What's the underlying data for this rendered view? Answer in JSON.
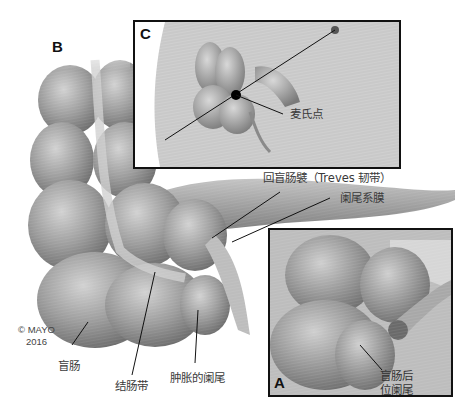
{
  "figure": {
    "panels": {
      "B": {
        "letter": "B"
      },
      "C": {
        "letter": "C",
        "labels": {
          "mcburney_point": "麦氏点"
        }
      },
      "A": {
        "letter": "A",
        "labels": {
          "retrocecal_appendix_line1": "盲肠后",
          "retrocecal_appendix_line2": "位阑尾"
        }
      }
    },
    "labels": {
      "ileocecal_fold": "回盲肠襞（Treves 韧带）",
      "mesoappendix": "阑尾系膜",
      "cecum": "盲肠",
      "taenia_coli": "结肠带",
      "swollen_appendix": "肿胀的阑尾"
    },
    "copyright": {
      "line1": "© MAYO",
      "line2": "2016"
    },
    "colors": {
      "tissue": "#9a9a9a",
      "tissue_light": "#c8c8c8",
      "tissue_dark": "#6e6e6e",
      "frame": "#111111",
      "background": "#ffffff"
    }
  }
}
